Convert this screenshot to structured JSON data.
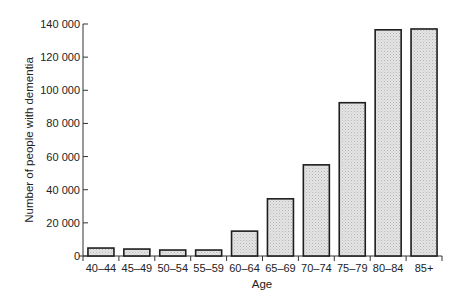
{
  "chart_data": {
    "type": "bar",
    "title": "",
    "xlabel": "Age",
    "ylabel": "Number of people with dementia",
    "categories": [
      "40–44",
      "45–49",
      "50–54",
      "55–59",
      "60–64",
      "65–69",
      "70–74",
      "75–79",
      "80–84",
      "85+"
    ],
    "values": [
      4800,
      4200,
      3600,
      3600,
      15000,
      34500,
      55000,
      92500,
      136500,
      137000
    ],
    "ylim": [
      0,
      140000
    ],
    "yticks": [
      0,
      20000,
      40000,
      60000,
      80000,
      100000,
      120000,
      140000
    ],
    "ytick_labels": [
      "0",
      "20 000",
      "40 000",
      "60 000",
      "80 000",
      "100 000",
      "120 000",
      "140 000"
    ],
    "grid": false,
    "legend": null,
    "colors": {
      "bar_fill": "#dcdcdc",
      "bar_stroke": "#1e1e1e",
      "axis": "#333333"
    }
  }
}
